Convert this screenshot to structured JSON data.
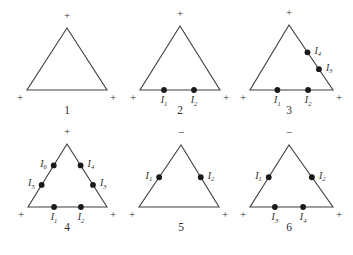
{
  "figure": {
    "background": "#ffffff",
    "line_color": "#3f3f3f",
    "dot_color": "#1a1a1a",
    "text_color": "#2e2e2e",
    "triangles": [
      {
        "number": "1",
        "top_sign": "+",
        "bottom_left_sign": "+",
        "bottom_right_sign": "+",
        "dots": []
      },
      {
        "number": "2",
        "top_sign": "+",
        "bottom_left_sign": "+",
        "bottom_right_sign": "+",
        "dots": [
          {
            "edge": "bottom",
            "t": 0.3,
            "symbol": "I",
            "sub": "1"
          },
          {
            "edge": "bottom",
            "t": 0.675,
            "symbol": "I",
            "sub": "2"
          }
        ]
      },
      {
        "number": "3",
        "top_sign": "+",
        "bottom_left_sign": "+",
        "bottom_right_sign": "+",
        "dots": [
          {
            "edge": "bottom",
            "t": 0.33,
            "symbol": "I",
            "sub": "1"
          },
          {
            "edge": "bottom",
            "t": 0.7,
            "symbol": "I",
            "sub": "2"
          },
          {
            "edge": "right",
            "t": 0.42,
            "symbol": "I",
            "sub": "4"
          },
          {
            "edge": "right",
            "t": 0.68,
            "symbol": "I",
            "sub": "3"
          }
        ]
      },
      {
        "number": "4",
        "top_sign": "+",
        "bottom_left_sign": "+",
        "bottom_right_sign": "+",
        "dots": [
          {
            "edge": "bottom",
            "t": 0.33,
            "symbol": "I",
            "sub": "1"
          },
          {
            "edge": "bottom",
            "t": 0.67,
            "symbol": "I",
            "sub": "2"
          },
          {
            "edge": "right",
            "t": 0.34,
            "symbol": "I",
            "sub": "4"
          },
          {
            "edge": "right",
            "t": 0.65,
            "symbol": "I",
            "sub": "3"
          },
          {
            "edge": "left",
            "t": 0.34,
            "symbol": "I",
            "sub": "6"
          },
          {
            "edge": "left",
            "t": 0.65,
            "symbol": "I",
            "sub": "5"
          }
        ]
      },
      {
        "number": "5",
        "top_sign": "−",
        "bottom_left_sign": "+",
        "bottom_right_sign": "+",
        "dots": [
          {
            "edge": "left",
            "t": 0.52,
            "symbol": "I",
            "sub": "1"
          },
          {
            "edge": "right",
            "t": 0.52,
            "symbol": "I",
            "sub": "2"
          }
        ]
      },
      {
        "number": "6",
        "top_sign": "−",
        "bottom_left_sign": "+",
        "bottom_right_sign": "+",
        "dots": [
          {
            "edge": "left",
            "t": 0.52,
            "symbol": "I",
            "sub": "1"
          },
          {
            "edge": "right",
            "t": 0.52,
            "symbol": "I",
            "sub": "2"
          },
          {
            "edge": "bottom",
            "t": 0.3,
            "symbol": "I",
            "sub": "3"
          },
          {
            "edge": "bottom",
            "t": 0.64,
            "symbol": "I",
            "sub": "4"
          }
        ]
      }
    ]
  }
}
